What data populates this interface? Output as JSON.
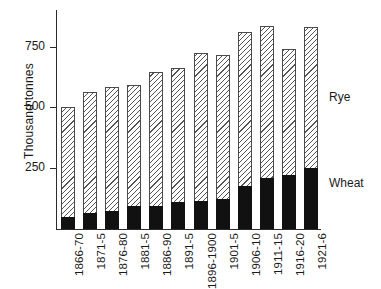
{
  "chart_data": {
    "type": "bar",
    "subtype": "stacked-vertical",
    "title": "",
    "xlabel": "",
    "ylabel": "Thousand tonnes",
    "ylim": [
      0,
      900
    ],
    "yticks": [
      250,
      500,
      750
    ],
    "ytick_labels": [
      "250",
      "500",
      "750"
    ],
    "grid": false,
    "legend_position": "right-inline",
    "categories": [
      "1866-70",
      "1871-5",
      "1876-80",
      "1881-5",
      "1886-90",
      "1891-5",
      "1896-1900",
      "1901-5",
      "1906-10",
      "1911-15",
      "1916-20",
      "1921-6"
    ],
    "series": [
      {
        "name": "Wheat",
        "fill": "solid-black",
        "color": "#111111",
        "values": [
          50,
          65,
          75,
          95,
          95,
          110,
          115,
          125,
          175,
          210,
          220,
          250
        ]
      },
      {
        "name": "Rye",
        "fill": "diagonal-hatch",
        "color": "#555555",
        "values": [
          450,
          500,
          510,
          495,
          550,
          550,
          610,
          590,
          635,
          625,
          520,
          580
        ]
      }
    ],
    "totals": [
      500,
      565,
      585,
      590,
      645,
      660,
      725,
      715,
      810,
      835,
      740,
      830
    ],
    "annotations": []
  },
  "legend": {
    "rye_label": "Rye",
    "wheat_label": "Wheat"
  },
  "axes": {
    "y_axis_title": "Thousand tonnes"
  }
}
